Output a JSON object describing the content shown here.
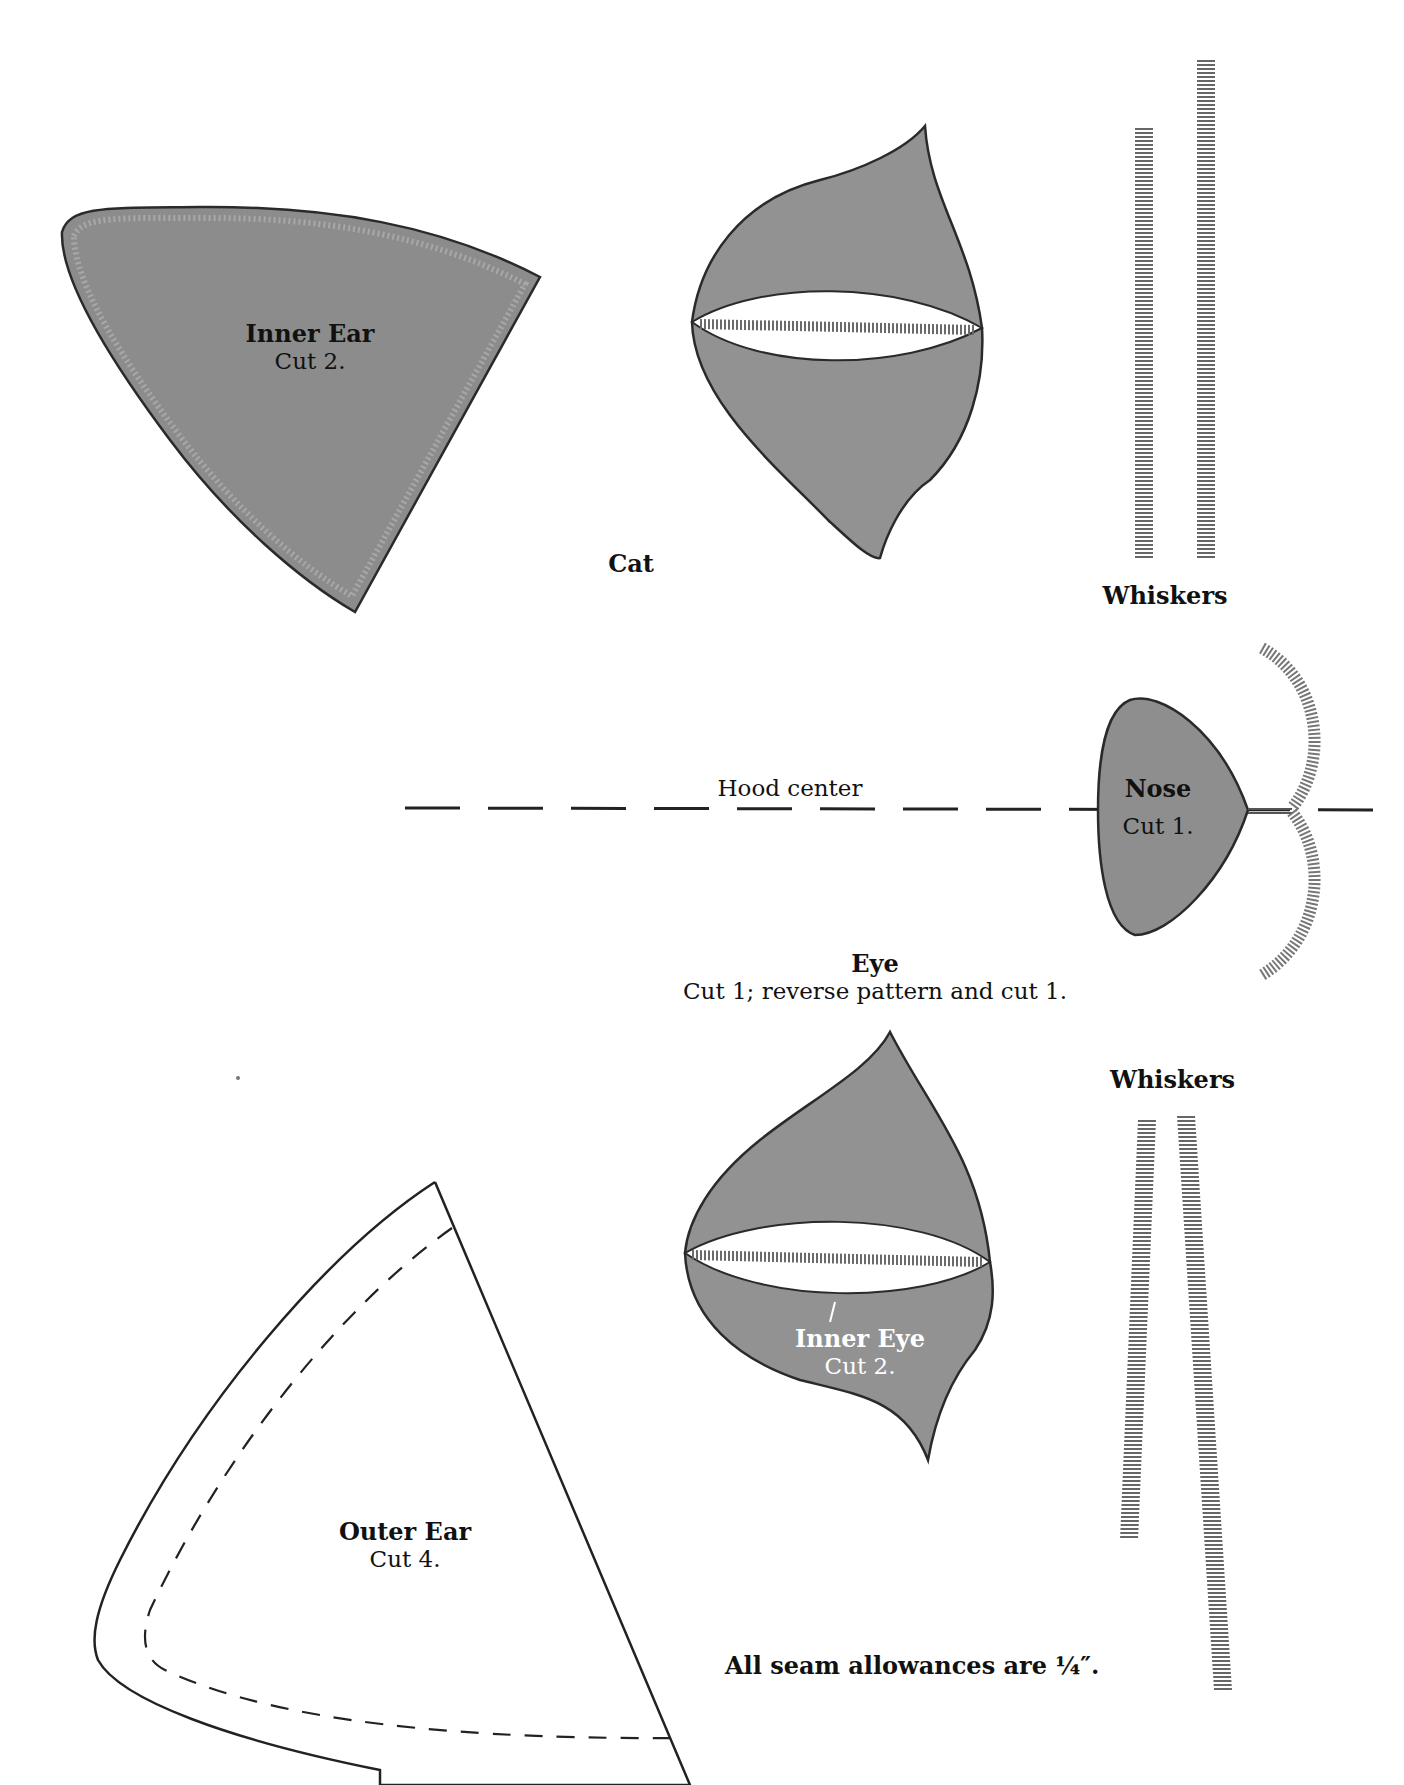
{
  "pattern_title": "Cat",
  "colors": {
    "fabric_fill": "#8e8e8e",
    "fabric_light": "#9c9c9c",
    "outline": "#2a2a2a",
    "stitch": "#7a7a7a",
    "paper": "#ffffff"
  },
  "pieces": {
    "inner_ear": {
      "name": "Inner Ear",
      "instruction": "Cut 2."
    },
    "eye": {
      "name": "Eye",
      "instruction": "Cut 1; reverse pattern and cut 1."
    },
    "inner_eye": {
      "name": "Inner Eye",
      "instruction": "Cut 2."
    },
    "nose": {
      "name": "Nose",
      "instruction": "Cut 1."
    },
    "outer_ear": {
      "name": "Outer Ear",
      "instruction": "Cut 4."
    }
  },
  "labels": {
    "whiskers_top": "Whiskers",
    "whiskers_bottom": "Whiskers",
    "hood_center": "Hood center",
    "seam_note": "All seam allowances are ¼″."
  }
}
